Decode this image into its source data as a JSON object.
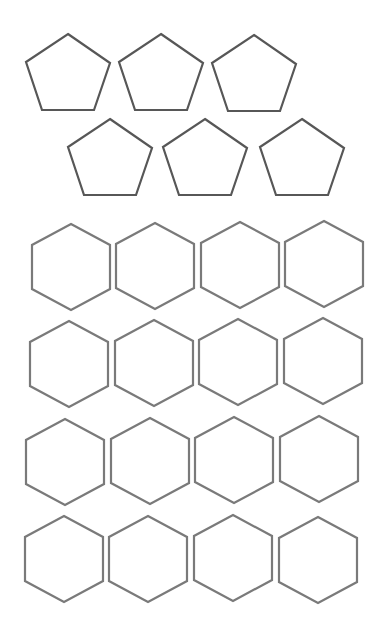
{
  "diagram": {
    "groups": [
      {
        "name": "pentagons",
        "shape": "pentagon",
        "sides": 5,
        "count": 6,
        "rows": [
          3,
          3
        ],
        "stroke_color": "#575757"
      },
      {
        "name": "hexagons",
        "shape": "hexagon",
        "sides": 6,
        "count": 16,
        "rows": [
          4,
          4,
          4,
          4
        ],
        "stroke_color": "#7a7a7a"
      }
    ]
  }
}
